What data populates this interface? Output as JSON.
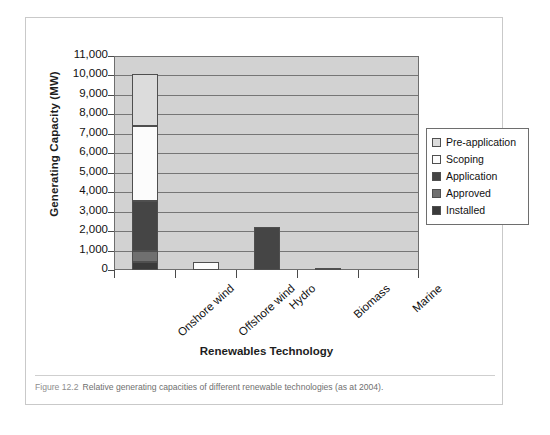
{
  "figure": {
    "caption_number": "Figure 12.2",
    "caption_text": "Relative generating capacities of different renewable technologies (as at 2004)."
  },
  "chart_data": {
    "type": "bar",
    "subtype": "stacked-vertical",
    "title": "",
    "xlabel": "Renewables Technology",
    "ylabel": "Generating Capacity (MW)",
    "ylim": [
      0,
      11000
    ],
    "ytick_labels": [
      "11,000",
      "10,000",
      "9,000",
      "8,000",
      "7,000",
      "6,000",
      "5,000",
      "4,000",
      "3,000",
      "2,000",
      "1,000",
      "0"
    ],
    "ytick_values": [
      11000,
      10000,
      9000,
      8000,
      7000,
      6000,
      5000,
      4000,
      3000,
      2000,
      1000,
      0
    ],
    "grid": true,
    "legend_position": "right",
    "categories": [
      "Onshore wind",
      "Offshore wind",
      "Hydro",
      "Biomass",
      "Marine"
    ],
    "series": [
      {
        "name": "Installed",
        "color": "#3a3a3a",
        "values": [
          400,
          0,
          0,
          0,
          0
        ]
      },
      {
        "name": "Approved",
        "color": "#707070",
        "values": [
          600,
          0,
          0,
          100,
          0
        ]
      },
      {
        "name": "Application",
        "color": "#454545",
        "values": [
          2550,
          0,
          2200,
          0,
          0
        ]
      },
      {
        "name": "Scoping",
        "color": "#fcfcfc",
        "values": [
          3850,
          400,
          0,
          0,
          0
        ]
      },
      {
        "name": "Pre-application",
        "color": "#dcdcdc",
        "values": [
          2700,
          0,
          0,
          0,
          0
        ]
      }
    ],
    "totals": [
      10100,
      400,
      2200,
      100,
      0
    ],
    "plot_background": "#d2d2d2",
    "gridline_color": "#767676"
  },
  "legend": {
    "items": [
      {
        "label": "Pre-application",
        "color": "#dcdcdc"
      },
      {
        "label": "Scoping",
        "color": "#fcfcfc"
      },
      {
        "label": "Application",
        "color": "#454545"
      },
      {
        "label": "Approved",
        "color": "#707070"
      },
      {
        "label": "Installed",
        "color": "#3a3a3a"
      }
    ]
  }
}
